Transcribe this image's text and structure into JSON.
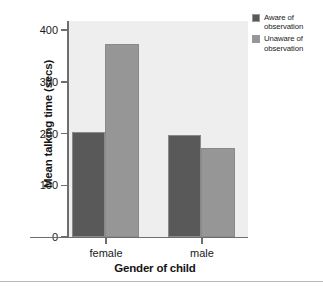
{
  "chart_data": {
    "type": "bar",
    "title": "",
    "subtitle": "",
    "xlabel": "Gender of child",
    "ylabel": "Mean talking time (secs)",
    "categories": [
      "female",
      "male"
    ],
    "series": [
      {
        "name": "Aware of observation",
        "values": [
          205,
          199
        ],
        "color": "#595959"
      },
      {
        "name": "Unaware of observation",
        "values": [
          375,
          174
        ],
        "color": "#969696"
      }
    ],
    "ylim": [
      0,
      420
    ],
    "yticks": [
      0,
      100,
      200,
      300,
      400
    ],
    "ytick_labels": [
      "0",
      "100",
      "200",
      "300",
      "400"
    ],
    "grid": false,
    "legend_position": "right-top",
    "plot_background": "#eeeeee",
    "axis_color": "#6e6e6e",
    "figure_background": "#ffffff"
  },
  "legend": {
    "entries": [
      {
        "line1": "Aware of",
        "line2": "observation"
      },
      {
        "line1": "Unaware of",
        "line2": "observation"
      }
    ]
  },
  "axis": {
    "y_label": "Mean talking time (secs)",
    "x_label": "Gender of child",
    "y_ticks": [
      "400",
      "300",
      "200",
      "100",
      "0"
    ],
    "x_ticks": [
      "female",
      "male"
    ]
  }
}
